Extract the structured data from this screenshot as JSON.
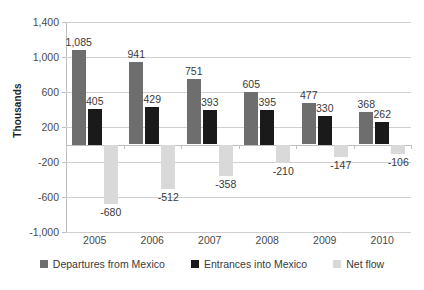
{
  "chart_data": {
    "type": "bar",
    "title": "",
    "xlabel": "",
    "ylabel": "Thousands",
    "categories": [
      "2005",
      "2006",
      "2007",
      "2008",
      "2009",
      "2010"
    ],
    "series": [
      {
        "name": "Departures from Mexico",
        "color": "#6e6e6e",
        "values": [
          1085,
          941,
          751,
          605,
          477,
          368
        ],
        "labels": [
          "1,085",
          "941",
          "751",
          "605",
          "477",
          "368"
        ]
      },
      {
        "name": "Entrances into Mexico",
        "color": "#1a1a1a",
        "values": [
          405,
          429,
          393,
          395,
          330,
          262
        ],
        "labels": [
          "405",
          "429",
          "393",
          "395",
          "330",
          "262"
        ]
      },
      {
        "name": "Net flow",
        "color": "#d9d9d9",
        "values": [
          -680,
          -512,
          -358,
          -210,
          -147,
          -106
        ],
        "labels": [
          "-680",
          "-512",
          "-358",
          "-210",
          "-147",
          "-106"
        ]
      }
    ],
    "ylim": [
      -1000,
      1400
    ],
    "ytick_values": [
      1400,
      1000,
      600,
      200,
      -200,
      -600,
      -1000
    ],
    "ytick_labels": [
      "1,400",
      "1,000",
      "600",
      "200",
      "-200",
      "-600",
      "-1,000"
    ],
    "grid": true,
    "legend_position": "bottom"
  }
}
